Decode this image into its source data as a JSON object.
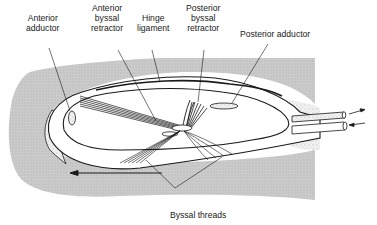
{
  "figure": {
    "colors": {
      "substrate": "#c9c9c9",
      "substrate_dots": "#9a9a9a",
      "stipple": "#e9e9e9",
      "stipple_dots": "#8a8a8a",
      "outline": "#1a1a1a",
      "body": "#ffffff"
    }
  },
  "labels": {
    "anterior_adductor": {
      "line1": "Anterior",
      "line2": "adductor"
    },
    "anterior_byssal_retractor": {
      "line1": "Anterior",
      "line2": "byssal",
      "line3": "retractor"
    },
    "hinge_ligament": {
      "line1": "Hinge",
      "line2": "ligament"
    },
    "posterior_byssal_retractor": {
      "line1": "Posterior",
      "line2": "byssal",
      "line3": "retractor"
    },
    "posterior_adductor": {
      "line1": "Posterior adductor"
    },
    "byssal_threads": {
      "line1": "Byssal threads"
    }
  },
  "annotations": {
    "movement_arrow": "leftward arrow indicating direction of movement",
    "siphon_arrows": [
      "outflow (exhalant) →",
      "inflow (inhalant) ←"
    ]
  }
}
